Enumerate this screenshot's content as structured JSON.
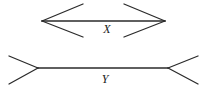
{
  "figure": {
    "name": "muller-lyer-illusion",
    "background_color": "#ffffff",
    "stroke_color": "#2b2b2b",
    "label_color": "#1a1a1a",
    "canvas": {
      "width": 208,
      "height": 91
    },
    "shafts": [
      {
        "id": "shaft-x",
        "label": "X",
        "label_x": 107,
        "label_y": 33,
        "x1": 42,
        "y1": 21,
        "x2": 165,
        "y2": 21,
        "stroke_width": 1.6,
        "fin_direction": "inward"
      },
      {
        "id": "shaft-y",
        "label": "Y",
        "label_x": 105,
        "label_y": 83,
        "x1": 38,
        "y1": 68,
        "x2": 168,
        "y2": 68,
        "stroke_width": 1.6,
        "fin_direction": "outward"
      }
    ],
    "fins": [
      {
        "id": "fin-x-top-left",
        "x1": 42,
        "y1": 21,
        "x2": 83,
        "y2": 4,
        "stroke_width": 1.3
      },
      {
        "id": "fin-x-bottom-left",
        "x1": 42,
        "y1": 21,
        "x2": 83,
        "y2": 37,
        "stroke_width": 1.3
      },
      {
        "id": "fin-x-top-right",
        "x1": 165,
        "y1": 21,
        "x2": 124,
        "y2": 4,
        "stroke_width": 1.3
      },
      {
        "id": "fin-x-bottom-right",
        "x1": 165,
        "y1": 21,
        "x2": 124,
        "y2": 37,
        "stroke_width": 1.3
      },
      {
        "id": "fin-y-top-left",
        "x1": 38,
        "y1": 68,
        "x2": 9,
        "y2": 56,
        "stroke_width": 1.3
      },
      {
        "id": "fin-y-bottom-left",
        "x1": 38,
        "y1": 68,
        "x2": 9,
        "y2": 84,
        "stroke_width": 1.3
      },
      {
        "id": "fin-y-top-right",
        "x1": 168,
        "y1": 68,
        "x2": 198,
        "y2": 56,
        "stroke_width": 1.3
      },
      {
        "id": "fin-y-bottom-right",
        "x1": 168,
        "y1": 68,
        "x2": 198,
        "y2": 84,
        "stroke_width": 1.3
      }
    ],
    "labels": {
      "top_label": "X",
      "bottom_label": "Y"
    }
  }
}
